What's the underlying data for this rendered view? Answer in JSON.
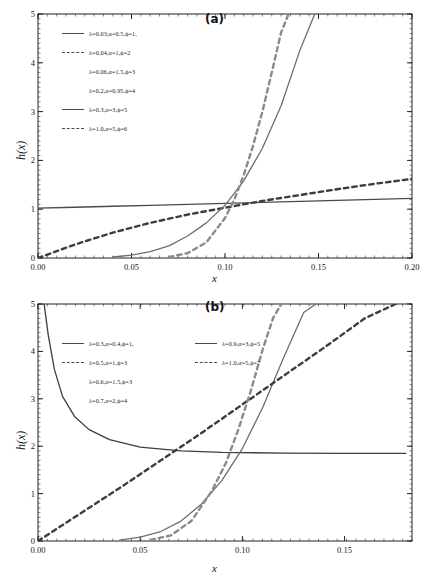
{
  "figure": {
    "panels": [
      {
        "id": "a",
        "letter": "(a)",
        "xlabel": "x",
        "ylabel": "h(x)",
        "xticks": [
          "0.00",
          "0.05",
          "0.10",
          "0.15",
          "0.20"
        ],
        "xtick_values": [
          0.0,
          0.05,
          0.1,
          0.15,
          0.2
        ],
        "yticks": [
          "0",
          "1",
          "2",
          "3",
          "4",
          "5"
        ],
        "ytick_values": [
          0,
          1,
          2,
          3,
          4,
          5
        ],
        "legend": [
          {
            "label": "λ=0.03,α=0.5,ϕ=1,",
            "style": "solid"
          },
          {
            "label": "λ=0.04,α=1,ϕ=2",
            "style": "dashed"
          },
          {
            "label": "λ=0.06,α=1.5,ϕ=3",
            "style": "none"
          },
          {
            "label": "λ=0.2,α=0.95,ϕ=4",
            "style": "none"
          },
          {
            "label": "λ=0.3,α=3,ϕ=5",
            "style": "solid"
          },
          {
            "label": "λ=1.0,α=5,ϕ=6",
            "style": "dashed"
          }
        ]
      },
      {
        "id": "b",
        "letter": "(b)",
        "xlabel": "x",
        "ylabel": "h(x)",
        "xticks": [
          "0.00",
          "0.05",
          "0.10",
          "0.15"
        ],
        "xtick_values": [
          0.0,
          0.05,
          0.1,
          0.15
        ],
        "yticks": [
          "0",
          "1",
          "2",
          "3",
          "4",
          "5"
        ],
        "ytick_values": [
          0,
          1,
          2,
          3,
          4,
          5
        ],
        "legend": [
          {
            "label": "λ=0.3,α=0.4,ϕ=1,",
            "style": "solid",
            "column": 0
          },
          {
            "label": "λ=0.9,α=3,ϕ=5",
            "style": "solid",
            "column": 1
          },
          {
            "label": "λ=0.5,α=1,ϕ=3",
            "style": "dashed",
            "column": 0
          },
          {
            "label": "λ=1.0,α=5,ϕ=7",
            "style": "dashed",
            "column": 1
          },
          {
            "label": "λ=0.6,α=1.5,ϕ=3",
            "style": "none",
            "column": 0
          },
          {
            "label": "λ=0.7,α=2,ϕ=4",
            "style": "none",
            "column": 0
          }
        ]
      }
    ]
  },
  "chart_data": [
    {
      "type": "line",
      "title": "(a)",
      "xlabel": "x",
      "ylabel": "h(x)",
      "xlim": [
        0.0,
        0.2
      ],
      "ylim": [
        0,
        5
      ],
      "xticks": [
        0.0,
        0.05,
        0.1,
        0.15,
        0.2
      ],
      "yticks": [
        0,
        1,
        2,
        3,
        4,
        5
      ],
      "grid": false,
      "legend_position": "upper-left",
      "series": [
        {
          "name": "λ=0.03,α=0.5,ϕ=1,",
          "style": "solid",
          "color": "#4a4a4a",
          "x": [
            0.0,
            0.02,
            0.04,
            0.06,
            0.08,
            0.1,
            0.12,
            0.14,
            0.16,
            0.18,
            0.2
          ],
          "y": [
            1.02,
            1.04,
            1.06,
            1.08,
            1.1,
            1.12,
            1.14,
            1.16,
            1.18,
            1.2,
            1.22
          ]
        },
        {
          "name": "λ=0.04,α=1,ϕ=2",
          "style": "dashed",
          "color": "#3d3d3d",
          "x": [
            0.0,
            0.02,
            0.04,
            0.06,
            0.08,
            0.1,
            0.12,
            0.14,
            0.16,
            0.18,
            0.2
          ],
          "y": [
            0.0,
            0.28,
            0.52,
            0.72,
            0.89,
            1.03,
            1.17,
            1.29,
            1.41,
            1.52,
            1.62
          ]
        },
        {
          "name": "λ=0.06,α=1.5,ϕ=3",
          "style": "none",
          "color": "#4a4a4a",
          "x": [],
          "y": []
        },
        {
          "name": "λ=0.2,α=0.95,ϕ=4",
          "style": "none",
          "color": "#4a4a4a",
          "x": [],
          "y": []
        },
        {
          "name": "λ=0.3,α=3,ϕ=5",
          "style": "solid",
          "color": "#6e6e6e",
          "x": [
            0.04,
            0.05,
            0.06,
            0.07,
            0.08,
            0.09,
            0.1,
            0.11,
            0.12,
            0.13,
            0.14,
            0.148
          ],
          "y": [
            0.02,
            0.06,
            0.13,
            0.25,
            0.45,
            0.72,
            1.08,
            1.58,
            2.25,
            3.12,
            4.25,
            5.0
          ]
        },
        {
          "name": "λ=1.0,α=5,ϕ=6",
          "style": "dashed",
          "color": "#8a8a8a",
          "x": [
            0.07,
            0.08,
            0.09,
            0.1,
            0.105,
            0.11,
            0.115,
            0.12,
            0.125,
            0.13,
            0.134
          ],
          "y": [
            0.02,
            0.1,
            0.32,
            0.82,
            1.2,
            1.7,
            2.3,
            3.0,
            3.8,
            4.62,
            5.0
          ]
        }
      ]
    },
    {
      "type": "line",
      "title": "(b)",
      "xlabel": "x",
      "ylabel": "h(x)",
      "xlim": [
        0.0,
        0.183
      ],
      "ylim": [
        0,
        5
      ],
      "xticks": [
        0.0,
        0.05,
        0.1,
        0.15
      ],
      "yticks": [
        0,
        1,
        2,
        3,
        4,
        5
      ],
      "grid": false,
      "legend_position": "center-left",
      "series": [
        {
          "name": "λ=0.3,α=0.4,ϕ=1,",
          "style": "solid",
          "color": "#3d3d3d",
          "x": [
            0.003,
            0.005,
            0.008,
            0.012,
            0.018,
            0.025,
            0.035,
            0.05,
            0.07,
            0.09,
            0.12,
            0.15,
            0.18
          ],
          "y": [
            5.0,
            4.35,
            3.62,
            3.05,
            2.62,
            2.35,
            2.14,
            1.98,
            1.9,
            1.87,
            1.855,
            1.85,
            1.85
          ]
        },
        {
          "name": "λ=0.9,α=3,ϕ=5",
          "style": "solid",
          "color": "#6e6e6e",
          "x": [
            0.04,
            0.05,
            0.06,
            0.07,
            0.08,
            0.09,
            0.1,
            0.11,
            0.12,
            0.13,
            0.136
          ],
          "y": [
            0.02,
            0.08,
            0.2,
            0.42,
            0.78,
            1.28,
            1.95,
            2.82,
            3.85,
            4.82,
            5.0
          ]
        },
        {
          "name": "λ=0.5,α=1,ϕ=3",
          "style": "dashed",
          "color": "#3d3d3d",
          "x": [
            0.0,
            0.02,
            0.04,
            0.06,
            0.08,
            0.1,
            0.12,
            0.14,
            0.16,
            0.175
          ],
          "y": [
            0.0,
            0.56,
            1.12,
            1.7,
            2.28,
            2.88,
            3.48,
            4.08,
            4.7,
            5.0
          ]
        },
        {
          "name": "λ=1.0,α=5,ϕ=7",
          "style": "dashed",
          "color": "#8a8a8a",
          "x": [
            0.055,
            0.065,
            0.075,
            0.085,
            0.092,
            0.098,
            0.104,
            0.11,
            0.115,
            0.119
          ],
          "y": [
            0.02,
            0.12,
            0.42,
            1.05,
            1.65,
            2.35,
            3.15,
            4.05,
            4.7,
            5.0
          ]
        },
        {
          "name": "λ=0.6,α=1.5,ϕ=3",
          "style": "none",
          "color": "#4a4a4a",
          "x": [],
          "y": []
        },
        {
          "name": "λ=0.7,α=2,ϕ=4",
          "style": "none",
          "color": "#4a4a4a",
          "x": [],
          "y": []
        }
      ]
    }
  ]
}
